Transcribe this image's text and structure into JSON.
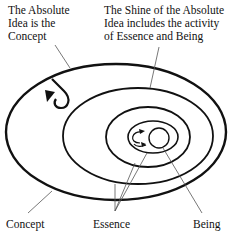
{
  "diagram": {
    "labels": {
      "absolute_idea": "The Absolute\nIdea is the\nConcept",
      "shine": "The Shine of the Absolute\nIdea includes the activity\nof Essence and Being",
      "concept": "Concept",
      "essence": "Essence",
      "being": "Being"
    },
    "colors": {
      "stroke": "#111111",
      "leader": "#555555",
      "background": "#ffffff"
    }
  }
}
